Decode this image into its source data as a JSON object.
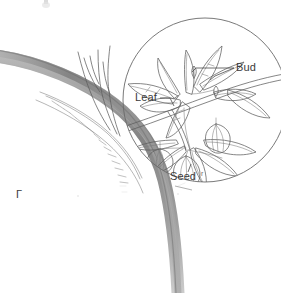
{
  "figure": {
    "medium": "pencil drawing",
    "background_color": "#ffffff",
    "width": 281,
    "height": 293
  },
  "labels": [
    {
      "id": "bud",
      "text": "Bud",
      "trailing_mark": "",
      "x": 236,
      "y": 71,
      "color": "#3a3a3a",
      "leader": "horizontal line pointing left to a bud on the stem"
    },
    {
      "id": "leaf",
      "text": "Leaf",
      "trailing_mark": "",
      "x": 135,
      "y": 101,
      "color": "#3a3a3a",
      "leader": "short line pointing right to a leaf blade"
    },
    {
      "id": "seed",
      "text": "Seed",
      "trailing_mark": "r",
      "x": 170,
      "y": 180,
      "color": "#3a3a3a",
      "leader": "short tick above pointing up to a hanging seed pod"
    }
  ],
  "parts": {
    "main_branch": {
      "name": "main-branch",
      "description": "thick shaded branch sweeping from upper-left down and curving to lower-right",
      "shade_color": "#8d8d8d"
    },
    "branch_fork": {
      "name": "branch-fork",
      "description": "two thin twigs forking upward from the main branch"
    },
    "bark_texture": {
      "name": "bark-texture",
      "description": "row of short hatching strokes along the lower edge of the branch"
    },
    "magnifier_circle": {
      "name": "magnifier-circle",
      "description": "large circle enclosing the magnified leafy twig detail",
      "cx": 205,
      "cy": 100,
      "r": 82,
      "stroke_color": "#6a6a6a"
    },
    "detail_twig": {
      "name": "detail-twig",
      "description": "magnified twig bearing leaves, buds and lantern-shaped seed pods"
    },
    "seed_pods": {
      "name": "seed-pods",
      "count": 3,
      "description": "lantern / bell shaped hanging seed pods"
    },
    "leaves": {
      "name": "leaves",
      "count": 12,
      "description": "lanceolate leaves with central midrib and side veins"
    }
  },
  "marks": {
    "corner_bracket": {
      "name": "corner-bracket-mark",
      "text": "Γ",
      "x": 18,
      "y": 196,
      "color": "#9a9a9a"
    },
    "top_crumb": {
      "name": "top-edge-smudge",
      "x": 46,
      "y": 0,
      "color": "#bdbdbd"
    }
  }
}
